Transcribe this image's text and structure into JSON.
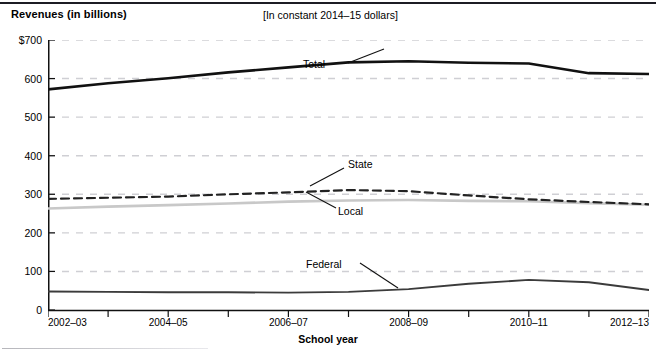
{
  "figure": {
    "y_axis_title": "Revenues (in billions)",
    "subtitle": "[In constant 2014–15 dollars]",
    "x_axis_title": "School year"
  },
  "colors": {
    "total": "#111111",
    "state": "#222222",
    "local": "#c8c8c8",
    "federal": "#3b3b3b",
    "gridline": "#cfcfd4",
    "axis": "#111111",
    "rule": "#1c1c24"
  },
  "series_labels": {
    "total": "Total",
    "state": "State",
    "local": "Local",
    "federal": "Federal"
  },
  "chart_data": {
    "type": "line",
    "title": "Revenues (in billions)",
    "subtitle": "[In constant 2014–15 dollars]",
    "xlabel": "School year",
    "ylabel": "Revenues (in billions)",
    "ylim": [
      0,
      700
    ],
    "yticks": [
      0,
      100,
      200,
      300,
      400,
      500,
      600,
      700
    ],
    "ytick_labels": [
      "0",
      "100",
      "200",
      "300",
      "400",
      "500",
      "600",
      "$700"
    ],
    "grid": "horizontal-dashed",
    "legend": "inline-annotations",
    "x": [
      "2002–03",
      "2003–04",
      "2004–05",
      "2005–06",
      "2006–07",
      "2007–08",
      "2008–09",
      "2009–10",
      "2010–11",
      "2011–12",
      "2012–13"
    ],
    "xtick_labels": [
      "2002–03",
      "2004–05",
      "2006–07",
      "2008–09",
      "2010–11",
      "2012–13"
    ],
    "series": [
      {
        "name": "Total",
        "style": "solid-thick",
        "values": [
          572,
          588,
          601,
          616,
          629,
          642,
          645,
          641,
          639,
          614,
          612
        ]
      },
      {
        "name": "State",
        "style": "dashed",
        "values": [
          288,
          291,
          294,
          300,
          305,
          311,
          308,
          297,
          287,
          280,
          274
        ]
      },
      {
        "name": "Local",
        "style": "solid-light",
        "values": [
          263,
          268,
          272,
          276,
          281,
          284,
          285,
          283,
          282,
          277,
          273
        ]
      },
      {
        "name": "Federal",
        "style": "solid-medium",
        "values": [
          48,
          47,
          46,
          46,
          45,
          47,
          54,
          68,
          78,
          72,
          52
        ]
      }
    ]
  }
}
